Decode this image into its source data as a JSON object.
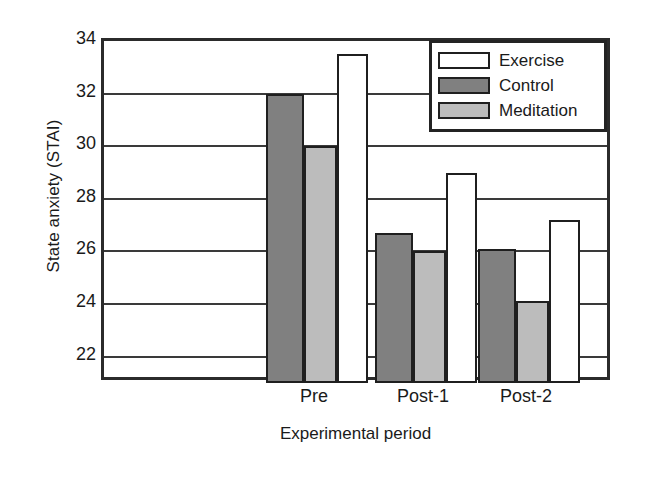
{
  "chart_data": {
    "type": "bar",
    "title": "",
    "xlabel": "Experimental period",
    "ylabel": "State anxiety (STAI)",
    "categories": [
      "Pre",
      "Post-1",
      "Post-2"
    ],
    "series": [
      {
        "name": "Exercise",
        "color": "#ffffff",
        "values": [
          33.5,
          29.0,
          27.2
        ]
      },
      {
        "name": "Control",
        "color": "#808080",
        "values": [
          32.0,
          26.7,
          26.1
        ]
      },
      {
        "name": "Meditation",
        "color": "#bcbcbc",
        "values": [
          30.0,
          26.0,
          24.1
        ]
      }
    ],
    "series_draw_order": [
      "Control",
      "Meditation",
      "Exercise"
    ],
    "ylim": [
      21.0,
      34.0
    ],
    "yticks": [
      34,
      32,
      30,
      28,
      26,
      24,
      22
    ],
    "ytick_labels": [
      "34",
      "32",
      "30",
      "28",
      "26",
      "24",
      "22"
    ],
    "grid": true,
    "grid_axis": "y",
    "legend_position": "top-right",
    "legend_entries": [
      "Exercise",
      "Control",
      "Meditation"
    ]
  },
  "axes": {
    "y_title": "State anxiety (STAI)",
    "x_title": "Experimental period"
  },
  "legend": {
    "items": [
      {
        "label": "Exercise",
        "swatch": "exercise"
      },
      {
        "label": "Control",
        "swatch": "control"
      },
      {
        "label": "Meditation",
        "swatch": "meditation"
      }
    ]
  }
}
